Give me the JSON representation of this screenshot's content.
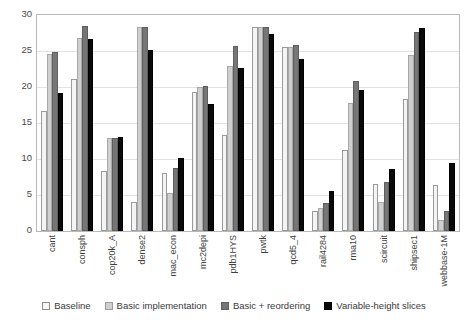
{
  "chart_data": {
    "type": "bar",
    "title": "",
    "xlabel": "",
    "ylabel": "",
    "ylim": [
      0,
      30
    ],
    "yticks": [
      0,
      5,
      10,
      15,
      20,
      25,
      30
    ],
    "grid": true,
    "legend_position": "bottom",
    "categories": [
      "cant",
      "consph",
      "cop20k_A",
      "dense2",
      "mac_econ",
      "mc2depi",
      "pdb1HYS",
      "pwtk",
      "qcd5_4",
      "rail4284",
      "rma10",
      "scircuit",
      "shipsec1",
      "webbase-1M"
    ],
    "series": [
      {
        "name": "Baseline",
        "color": "#f4f4f4",
        "values": [
          16.6,
          21.1,
          8.4,
          4.0,
          8.0,
          19.3,
          13.4,
          28.3,
          25.5,
          2.8,
          11.2,
          6.5,
          18.3,
          6.4
        ]
      },
      {
        "name": "Basic implementation",
        "color": "#cfcfcf",
        "values": [
          24.6,
          26.8,
          12.9,
          28.3,
          5.3,
          20.0,
          22.9,
          28.3,
          25.6,
          3.2,
          17.8,
          4.0,
          24.4,
          1.5
        ]
      },
      {
        "name": "Basic + reordering",
        "color": "#767676",
        "values": [
          24.8,
          28.5,
          12.9,
          28.3,
          8.7,
          20.1,
          25.7,
          28.3,
          25.9,
          3.9,
          20.9,
          6.8,
          27.7,
          2.8
        ]
      },
      {
        "name": "Variable-height slices",
        "color": "#0a0a0a",
        "values": [
          19.2,
          26.6,
          13.1,
          25.1,
          10.2,
          17.6,
          22.6,
          27.3,
          23.9,
          5.5,
          19.6,
          8.6,
          28.2,
          9.5
        ]
      }
    ]
  },
  "legend": {
    "items": [
      {
        "label": "Baseline"
      },
      {
        "label": "Basic implementation"
      },
      {
        "label": "Basic + reordering"
      },
      {
        "label": "Variable-height slices"
      }
    ]
  }
}
